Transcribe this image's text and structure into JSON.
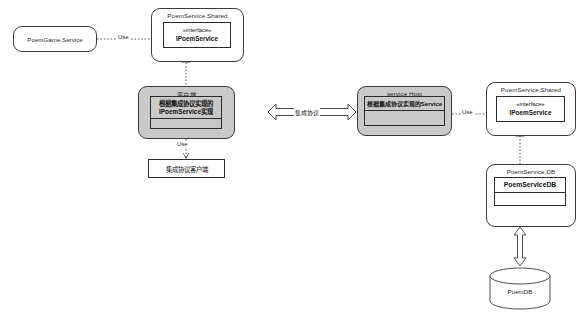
{
  "diagram": {
    "type": "uml-component-diagram",
    "title": "",
    "colors": {
      "stroke": "#2b2b2b",
      "shade_fill": "#c9c9c9",
      "plain_fill": "#ffffff",
      "dotted_edge": "#555555"
    },
    "nodes": {
      "poemgame_service": {
        "label": "PoemGame.Service"
      },
      "shared_left": {
        "package_label": "PoemService.Shared",
        "interface_stereotype": "«interface»",
        "interface_name": "IPoemService"
      },
      "client_package": {
        "package_label": "客户端",
        "class_line1": "根据集成协议实现的",
        "class_line2": "IPoemService实现"
      },
      "protocol_client": {
        "label": "集成协议客户端"
      },
      "service_host": {
        "package_label": "service Host",
        "class_label": "根据集成协议实现的Service"
      },
      "shared_right": {
        "package_label": "PoemService.Shared",
        "interface_stereotype": "«interface»",
        "interface_name": "IPoemService"
      },
      "db_package": {
        "package_label": "PoemService.DB",
        "class_label": "PoemServiceDB"
      },
      "database": {
        "label": "PoemDB"
      }
    },
    "edges": {
      "use_left": {
        "label": "Use"
      },
      "realize_left": {
        "label": ""
      },
      "use_client_protocol": {
        "label": "Use"
      },
      "integration_protocol": {
        "label": "集成协议"
      },
      "use_right": {
        "label": "Use"
      },
      "realize_right": {
        "label": ""
      },
      "db_link": {
        "label": ""
      }
    }
  }
}
